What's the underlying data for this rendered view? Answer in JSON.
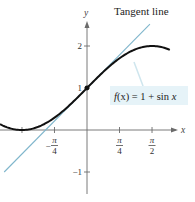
{
  "chart_data": {
    "type": "line",
    "title": "",
    "xlabel": "x",
    "ylabel": "y",
    "xlim": [
      -2.1,
      2.15
    ],
    "ylim": [
      -1.05,
      2.6
    ],
    "grid": false,
    "x_ticks": [
      {
        "value": -1.5708,
        "label": ""
      },
      {
        "value": -0.7854,
        "label_num": "π",
        "label_den": "4",
        "label_sign": "−"
      },
      {
        "value": 0.7854,
        "label_num": "π",
        "label_den": "4",
        "label_sign": ""
      },
      {
        "value": 1.5708,
        "label_num": "π",
        "label_den": "2",
        "label_sign": ""
      }
    ],
    "y_ticks": [
      {
        "value": 2,
        "label": "2"
      },
      {
        "value": 1,
        "label": "1"
      },
      {
        "value": -1,
        "label": "−1"
      }
    ],
    "series": [
      {
        "name": "f(x) = 1 + sin x",
        "kind": "curve",
        "color": "#111111",
        "function": "1 + sin x",
        "x_range": [
          -2.1,
          2.0
        ]
      },
      {
        "name": "Tangent line",
        "kind": "line",
        "color": "#7fb6cc",
        "function": "x + 1",
        "x_range": [
          -2.0,
          1.52
        ]
      }
    ],
    "points": [
      {
        "x": 0,
        "y": 1,
        "label": "point of tangency"
      }
    ],
    "annotations": [
      {
        "text": "Tangent line",
        "position": "top-right"
      },
      {
        "text_pre": "f",
        "text_var": "(x)",
        "text_post": " = 1 + sin ",
        "text_x": "x",
        "position": "right, boxed with leader to curve"
      }
    ]
  },
  "labels": {
    "tangent_title": "Tangent line",
    "x_axis": "x",
    "y_axis": "y",
    "fn_f": "f",
    "fn_paren": "(x)",
    "fn_rest": " = 1 + sin ",
    "fn_x": "x"
  },
  "colors": {
    "curve": "#111111",
    "tangent": "#7fb6cc",
    "label_box": "#e6f3f8",
    "axis": "#6b6b6b"
  },
  "layout": {
    "origin_px": [
      87,
      130
    ],
    "x_scale": 41.4,
    "y_scale": 42
  }
}
